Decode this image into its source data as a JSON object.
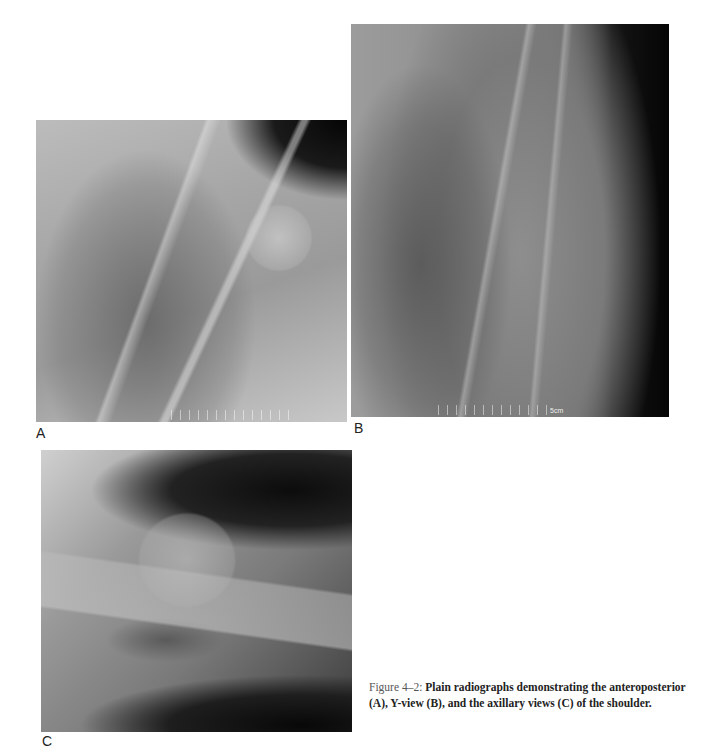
{
  "figure": {
    "panels": [
      {
        "id": "A",
        "label": "A",
        "description": "Anteroposterior radiograph of the shoulder"
      },
      {
        "id": "B",
        "label": "B",
        "description": "Y-view radiograph of the shoulder",
        "scale_text": "5cm"
      },
      {
        "id": "C",
        "label": "C",
        "description": "Axillary view radiograph of the shoulder"
      }
    ],
    "caption": {
      "number": "Figure 4–2:",
      "part1": "Plain radiographs demonstrating the anteroposterior ",
      "ref_a": "(A)",
      "part2": ", Y-view ",
      "ref_b": "(B)",
      "part3": ", and the axillary views ",
      "ref_c": "(C)",
      "part4": " of the shoulder."
    }
  }
}
